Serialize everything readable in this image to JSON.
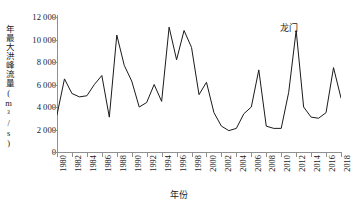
{
  "chart_data": {
    "type": "line",
    "title": "",
    "annotation": "龙门",
    "xlabel": "年份",
    "ylabel": "年最大洪峰流量(m³/s)",
    "xlim": [
      1980,
      2018
    ],
    "ylim": [
      0,
      12000
    ],
    "xtick_step": 2,
    "ytick_step": 2000,
    "grid": false,
    "legend": "none",
    "line_color": "#1a1a1a",
    "ytick_labels": [
      "0",
      "2 000",
      "4 000",
      "6 000",
      "8 000",
      "10 000",
      "12 000"
    ],
    "ytick_values": [
      0,
      2000,
      4000,
      6000,
      8000,
      10000,
      12000
    ],
    "xtick_labels": [
      "1980",
      "1982",
      "1984",
      "1986",
      "1988",
      "1990",
      "1992",
      "1994",
      "1996",
      "1998",
      "2000",
      "2002",
      "2004",
      "2006",
      "2008",
      "2010",
      "2012",
      "2014",
      "2016",
      "2018"
    ],
    "x": [
      1980,
      1981,
      1982,
      1983,
      1984,
      1985,
      1986,
      1987,
      1988,
      1989,
      1990,
      1991,
      1992,
      1993,
      1994,
      1995,
      1996,
      1997,
      1998,
      1999,
      2000,
      2001,
      2002,
      2003,
      2004,
      2005,
      2006,
      2007,
      2008,
      2009,
      2010,
      2011,
      2012,
      2013,
      2014,
      2015,
      2016,
      2017,
      2018
    ],
    "values": [
      3300,
      6500,
      5200,
      4900,
      5000,
      6000,
      6800,
      3100,
      10400,
      7700,
      6300,
      4000,
      4400,
      6000,
      4500,
      11100,
      8200,
      10800,
      9300,
      5100,
      6200,
      3500,
      2300,
      1900,
      2100,
      3400,
      4000,
      7300,
      2300,
      2100,
      2100,
      5300,
      10800,
      4000,
      3100,
      3000,
      3500,
      7500,
      4800
    ],
    "units": "m³/s"
  }
}
